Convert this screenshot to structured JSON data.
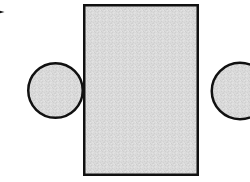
{
  "figure": {
    "canvas": {
      "width": 250,
      "height": 182,
      "background_color": "#ffffff"
    },
    "style": {
      "fill_color": "#d8d8d8",
      "stroke_color": "#111111",
      "texture": "dither-noise",
      "stroke_width": 2.5
    },
    "shapes": [
      {
        "id": "left-circle",
        "kind": "circle",
        "label": "left circle",
        "cx": 55.5,
        "cy": 90.5,
        "r": 28.5,
        "fill_color": "#d8d8d8",
        "stroke_color": "#111111",
        "stroke_width": 2.5
      },
      {
        "id": "right-circle",
        "kind": "circle",
        "label": "right circle",
        "cx": 240,
        "cy": 91,
        "r": 29.5,
        "fill_color": "#d8d8d8",
        "stroke_color": "#111111",
        "stroke_width": 2.5,
        "clipped": "right edge"
      },
      {
        "id": "center-rectangle",
        "kind": "rectangle",
        "label": "center rectangle",
        "x": 83,
        "y": 4,
        "width": 116,
        "height": 172,
        "fill_color": "#d8d8d8",
        "stroke_color": "#111111",
        "stroke_width": 2.5
      }
    ],
    "marker": {
      "id": "corner-marker",
      "label": "arrow marker",
      "x": 0,
      "y": 9,
      "width": 4.5,
      "height": 6,
      "color": "#111111",
      "clipped": "left edge"
    }
  }
}
